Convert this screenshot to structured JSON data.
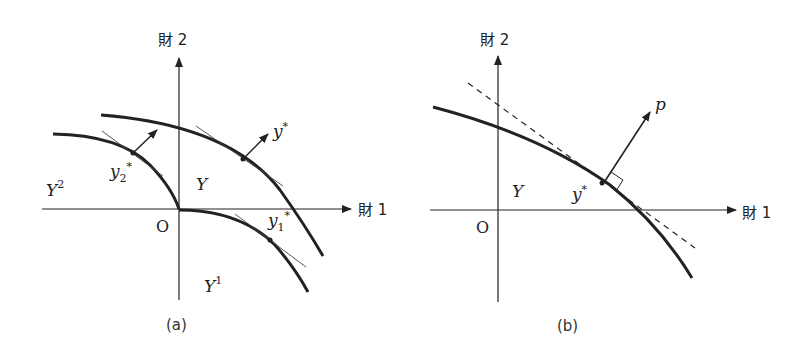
{
  "panel_a": {
    "caption": "(a)",
    "axis_x_label": "財 1",
    "axis_y_label": "財 2",
    "origin_label": "O",
    "set_Y": "Y",
    "set_Y1_base": "Y",
    "set_Y1_sup": "1",
    "set_Y2_base": "Y",
    "set_Y2_sup": "2",
    "point_y_star_base": "y",
    "point_y_star_sup": "*",
    "point_y1_star_base": "y",
    "point_y1_star_sub": "1",
    "point_y1_star_sup": "*",
    "point_y2_star_base": "y",
    "point_y2_star_sub": "2",
    "point_y2_star_sup": "*"
  },
  "panel_b": {
    "caption": "(b)",
    "axis_x_label": "財 1",
    "axis_y_label": "財 2",
    "origin_label": "O",
    "set_Y": "Y",
    "point_y_star_base": "y",
    "point_y_star_sup": "*",
    "price_vector_label": "p"
  },
  "colors": {
    "ink": "#222222",
    "background": "#ffffff"
  }
}
